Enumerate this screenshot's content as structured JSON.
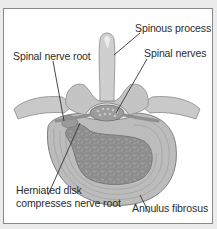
{
  "figure": {
    "type": "anatomical-diagram",
    "labels": {
      "spinous_process": "Spinous process",
      "spinal_nerves": "Spinal nerves",
      "spinal_nerve_root": "Spinal nerve root",
      "herniated_disk_line1": "Herniated disk",
      "herniated_disk_line2": "compresses nerve root",
      "annulus_fibrosus": "Annulus fibrosus"
    },
    "colors": {
      "frame_bg": "#ffffff",
      "outer_bg": "#ececec",
      "border": "#8a8a8a",
      "bone": "#c9c9c9",
      "bone_shadow": "#a9a9a9",
      "disk_ring": "#bdbdbd",
      "nucleus": "#8f8f8f",
      "leader_line": "#333333"
    }
  }
}
